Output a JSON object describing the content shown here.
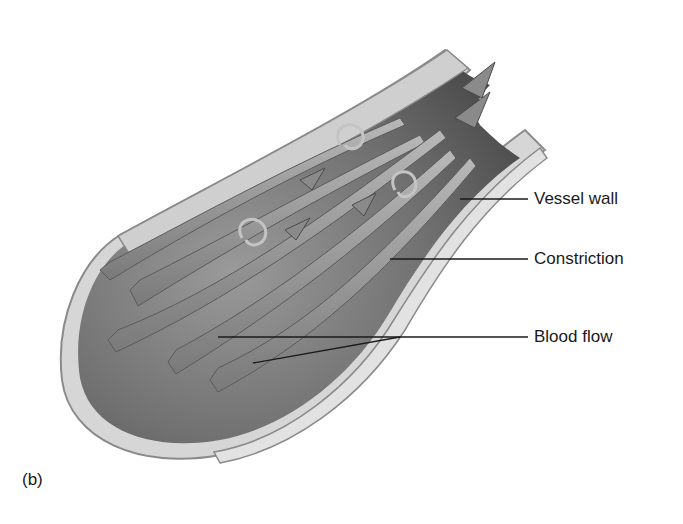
{
  "figure": {
    "panel_label": "(b)",
    "labels": [
      {
        "id": "vessel-wall",
        "text": "Vessel wall",
        "x": 534,
        "y": 191
      },
      {
        "id": "constriction",
        "text": "Constriction",
        "x": 534,
        "y": 250
      },
      {
        "id": "blood-flow",
        "text": "Blood flow",
        "x": 534,
        "y": 326
      }
    ],
    "colors": {
      "background": "#ffffff",
      "wall_outer": "#d9d9d9",
      "wall_edge": "#8a8a8a",
      "lumen_dark": "#5a5a5a",
      "lumen_mid": "#8c8c8c",
      "stream": "#9a9a9a",
      "stream_highlight": "#c8c8c8",
      "leader_line": "#1a1a1a"
    }
  }
}
